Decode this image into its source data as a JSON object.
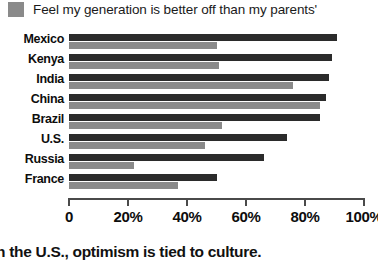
{
  "legend": {
    "swatch_name": "legend-swatch-gray",
    "swatch_color": "#8a8a8a",
    "label": "Feel my generation is better off than my parents'"
  },
  "colors": {
    "series_dark": "#2b2b2b",
    "series_gray": "#8a8a8a",
    "axis": "#4a4a4a",
    "text": "#0d0d0d",
    "background": "#ffffff"
  },
  "axis": {
    "ticks": [
      {
        "label": "0",
        "value": 0
      },
      {
        "label": "20%",
        "value": 20
      },
      {
        "label": "40%",
        "value": 40
      },
      {
        "label": "60%",
        "value": 60
      },
      {
        "label": "80%",
        "value": 80
      },
      {
        "label": "100%",
        "value": 100
      }
    ]
  },
  "caption": "n the U.S., optimism is tied to culture.",
  "chart_data": {
    "type": "bar",
    "orientation": "horizontal",
    "title": "",
    "subtitle": "",
    "xlabel": "",
    "ylabel": "",
    "xlim": [
      0,
      100
    ],
    "grid": false,
    "legend_position": "top-left",
    "categories": [
      "Mexico",
      "Kenya",
      "India",
      "China",
      "Brazil",
      "U.S.",
      "Russia",
      "France"
    ],
    "series": [
      {
        "name": "dark-series",
        "color": "#2b2b2b",
        "values": [
          91,
          89,
          88,
          87,
          85,
          74,
          66,
          50
        ]
      },
      {
        "name": "Feel my generation is better off than my parents'",
        "color": "#8a8a8a",
        "values": [
          50,
          51,
          76,
          85,
          52,
          46,
          22,
          37
        ]
      }
    ],
    "annotations": [
      "n the U.S., optimism is tied to culture."
    ]
  }
}
